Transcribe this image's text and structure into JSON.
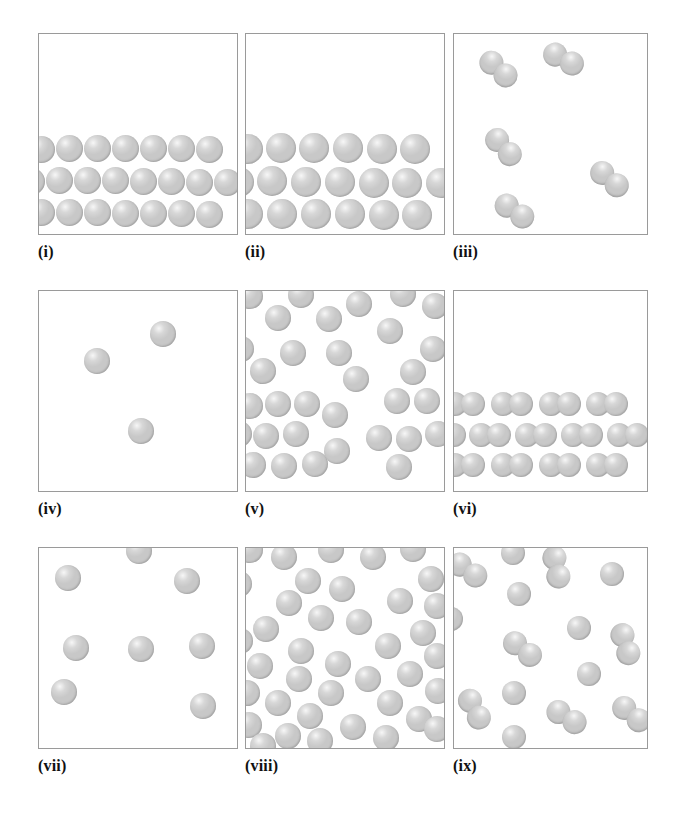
{
  "figure": {
    "title": "",
    "kind": "particle-arrangement-panels",
    "panel_count": 9,
    "background_color": "#ffffff",
    "frame_color": "#9a9a9a",
    "particle_color": "#c8c8c8"
  },
  "panels": [
    {
      "id": "i",
      "label": "(i)",
      "row": 0,
      "col": 0,
      "box": {
        "x": 38,
        "y": 33,
        "w": 200,
        "h": 202
      },
      "label_pos": {
        "x": 38,
        "y": 243
      },
      "description": "ordered close-packed rows of single atoms settled at bottom of container",
      "particle_type": "atom",
      "particle_count": 22,
      "radius": 13.5,
      "particles": [
        {
          "x": 40,
          "y": 148
        },
        {
          "x": 68,
          "y": 147
        },
        {
          "x": 96,
          "y": 147
        },
        {
          "x": 124,
          "y": 147
        },
        {
          "x": 152,
          "y": 147
        },
        {
          "x": 180,
          "y": 147
        },
        {
          "x": 208,
          "y": 148
        },
        {
          "x": 30,
          "y": 180
        },
        {
          "x": 58,
          "y": 179
        },
        {
          "x": 86,
          "y": 179
        },
        {
          "x": 114,
          "y": 179
        },
        {
          "x": 142,
          "y": 180
        },
        {
          "x": 170,
          "y": 180
        },
        {
          "x": 198,
          "y": 181
        },
        {
          "x": 226,
          "y": 181
        },
        {
          "x": 40,
          "y": 211
        },
        {
          "x": 68,
          "y": 211
        },
        {
          "x": 96,
          "y": 211
        },
        {
          "x": 124,
          "y": 212
        },
        {
          "x": 152,
          "y": 212
        },
        {
          "x": 180,
          "y": 212
        },
        {
          "x": 208,
          "y": 213
        }
      ],
      "molecules": []
    },
    {
      "id": "ii",
      "label": "(ii)",
      "row": 0,
      "col": 1,
      "box": {
        "x": 245,
        "y": 33,
        "w": 200,
        "h": 202
      },
      "label_pos": {
        "x": 245,
        "y": 243
      },
      "description": "ordered rows of larger single atoms settled at bottom of container",
      "particle_type": "atom",
      "particle_count": 19,
      "radius": 15,
      "particles": [
        {
          "x": 247,
          "y": 148
        },
        {
          "x": 280,
          "y": 147
        },
        {
          "x": 313,
          "y": 147
        },
        {
          "x": 347,
          "y": 147
        },
        {
          "x": 381,
          "y": 148
        },
        {
          "x": 414,
          "y": 148
        },
        {
          "x": 238,
          "y": 181
        },
        {
          "x": 271,
          "y": 180
        },
        {
          "x": 305,
          "y": 181
        },
        {
          "x": 339,
          "y": 181
        },
        {
          "x": 373,
          "y": 182
        },
        {
          "x": 406,
          "y": 182
        },
        {
          "x": 440,
          "y": 182
        },
        {
          "x": 247,
          "y": 213
        },
        {
          "x": 281,
          "y": 213
        },
        {
          "x": 315,
          "y": 213
        },
        {
          "x": 349,
          "y": 213
        },
        {
          "x": 383,
          "y": 214
        },
        {
          "x": 416,
          "y": 214
        }
      ],
      "molecules": []
    },
    {
      "id": "iii",
      "label": "(iii)",
      "row": 0,
      "col": 2,
      "box": {
        "x": 453,
        "y": 33,
        "w": 195,
        "h": 202
      },
      "label_pos": {
        "x": 453,
        "y": 243
      },
      "description": "sparse diatomic molecules dispersed throughout container (molecular gas)",
      "particle_type": "diatomic",
      "particle_count": 5,
      "radius": 12,
      "particles": [],
      "molecules": [
        {
          "x": 497,
          "y": 68,
          "angle": 42
        },
        {
          "x": 562,
          "y": 58,
          "angle": 28
        },
        {
          "x": 502,
          "y": 146,
          "angle": 48
        },
        {
          "x": 608,
          "y": 178,
          "angle": 40
        },
        {
          "x": 513,
          "y": 210,
          "angle": 35
        }
      ]
    },
    {
      "id": "iv",
      "label": "(iv)",
      "row": 1,
      "col": 0,
      "box": {
        "x": 38,
        "y": 290,
        "w": 200,
        "h": 202
      },
      "label_pos": {
        "x": 38,
        "y": 500
      },
      "description": "three widely separated single atoms (dilute monatomic gas)",
      "particle_type": "atom",
      "particle_count": 3,
      "radius": 13,
      "particles": [
        {
          "x": 96,
          "y": 360
        },
        {
          "x": 162,
          "y": 333
        },
        {
          "x": 140,
          "y": 430
        }
      ],
      "molecules": []
    },
    {
      "id": "v",
      "label": "(v)",
      "row": 1,
      "col": 1,
      "box": {
        "x": 245,
        "y": 290,
        "w": 200,
        "h": 202
      },
      "label_pos": {
        "x": 245,
        "y": 500
      },
      "description": "dense disordered single atoms filling the container (liquid)",
      "particle_type": "atom",
      "particle_count": 32,
      "radius": 13,
      "particles": [
        {
          "x": 249,
          "y": 295
        },
        {
          "x": 300,
          "y": 294
        },
        {
          "x": 358,
          "y": 303
        },
        {
          "x": 402,
          "y": 293
        },
        {
          "x": 434,
          "y": 305
        },
        {
          "x": 277,
          "y": 317
        },
        {
          "x": 328,
          "y": 318
        },
        {
          "x": 389,
          "y": 330
        },
        {
          "x": 240,
          "y": 348
        },
        {
          "x": 292,
          "y": 352
        },
        {
          "x": 338,
          "y": 352
        },
        {
          "x": 432,
          "y": 348
        },
        {
          "x": 262,
          "y": 370
        },
        {
          "x": 412,
          "y": 371
        },
        {
          "x": 355,
          "y": 378
        },
        {
          "x": 249,
          "y": 405
        },
        {
          "x": 277,
          "y": 403
        },
        {
          "x": 306,
          "y": 403
        },
        {
          "x": 334,
          "y": 414
        },
        {
          "x": 396,
          "y": 400
        },
        {
          "x": 426,
          "y": 400
        },
        {
          "x": 238,
          "y": 433
        },
        {
          "x": 265,
          "y": 435
        },
        {
          "x": 295,
          "y": 433
        },
        {
          "x": 378,
          "y": 437
        },
        {
          "x": 408,
          "y": 438
        },
        {
          "x": 437,
          "y": 433
        },
        {
          "x": 252,
          "y": 464
        },
        {
          "x": 283,
          "y": 465
        },
        {
          "x": 314,
          "y": 463
        },
        {
          "x": 336,
          "y": 450
        },
        {
          "x": 398,
          "y": 466
        }
      ],
      "molecules": []
    },
    {
      "id": "vi",
      "label": "(vi)",
      "row": 1,
      "col": 2,
      "box": {
        "x": 453,
        "y": 290,
        "w": 195,
        "h": 202
      },
      "label_pos": {
        "x": 453,
        "y": 500
      },
      "description": "ordered rows of horizontal diatomic molecules settled at bottom (molecular solid)",
      "particle_type": "diatomic",
      "particle_count": 13,
      "radius": 12,
      "particles": [],
      "molecules": [
        {
          "x": 463,
          "y": 403,
          "angle": 0
        },
        {
          "x": 511,
          "y": 403,
          "angle": 0
        },
        {
          "x": 559,
          "y": 403,
          "angle": 0
        },
        {
          "x": 606,
          "y": 403,
          "angle": 0
        },
        {
          "x": 444,
          "y": 434,
          "angle": 0
        },
        {
          "x": 489,
          "y": 434,
          "angle": 0
        },
        {
          "x": 535,
          "y": 434,
          "angle": 0
        },
        {
          "x": 581,
          "y": 434,
          "angle": 0
        },
        {
          "x": 627,
          "y": 434,
          "angle": 0
        },
        {
          "x": 463,
          "y": 464,
          "angle": 0
        },
        {
          "x": 511,
          "y": 464,
          "angle": 0
        },
        {
          "x": 559,
          "y": 464,
          "angle": 0
        },
        {
          "x": 606,
          "y": 464,
          "angle": 0
        }
      ]
    },
    {
      "id": "vii",
      "label": "(vii)",
      "row": 2,
      "col": 0,
      "box": {
        "x": 38,
        "y": 547,
        "w": 200,
        "h": 202
      },
      "label_pos": {
        "x": 38,
        "y": 757
      },
      "description": "eight widely separated single atoms (monatomic gas)",
      "particle_type": "atom",
      "particle_count": 8,
      "radius": 13,
      "particles": [
        {
          "x": 138,
          "y": 550
        },
        {
          "x": 67,
          "y": 577
        },
        {
          "x": 186,
          "y": 580
        },
        {
          "x": 75,
          "y": 647
        },
        {
          "x": 140,
          "y": 648
        },
        {
          "x": 201,
          "y": 645
        },
        {
          "x": 63,
          "y": 691
        },
        {
          "x": 202,
          "y": 705
        }
      ],
      "molecules": []
    },
    {
      "id": "viii",
      "label": "(viii)",
      "row": 2,
      "col": 1,
      "box": {
        "x": 245,
        "y": 547,
        "w": 200,
        "h": 202
      },
      "label_pos": {
        "x": 245,
        "y": 757
      },
      "description": "dense disordered single atoms filling the container (liquid)",
      "particle_type": "atom",
      "particle_count": 39,
      "radius": 13,
      "particles": [
        {
          "x": 249,
          "y": 549
        },
        {
          "x": 283,
          "y": 556
        },
        {
          "x": 330,
          "y": 549
        },
        {
          "x": 372,
          "y": 556
        },
        {
          "x": 412,
          "y": 548
        },
        {
          "x": 238,
          "y": 583
        },
        {
          "x": 307,
          "y": 580
        },
        {
          "x": 341,
          "y": 588
        },
        {
          "x": 430,
          "y": 578
        },
        {
          "x": 288,
          "y": 602
        },
        {
          "x": 399,
          "y": 600
        },
        {
          "x": 436,
          "y": 605
        },
        {
          "x": 320,
          "y": 617
        },
        {
          "x": 358,
          "y": 621
        },
        {
          "x": 265,
          "y": 628
        },
        {
          "x": 422,
          "y": 632
        },
        {
          "x": 239,
          "y": 640
        },
        {
          "x": 387,
          "y": 645
        },
        {
          "x": 300,
          "y": 650
        },
        {
          "x": 436,
          "y": 655
        },
        {
          "x": 259,
          "y": 665
        },
        {
          "x": 337,
          "y": 663
        },
        {
          "x": 298,
          "y": 678
        },
        {
          "x": 367,
          "y": 678
        },
        {
          "x": 409,
          "y": 673
        },
        {
          "x": 246,
          "y": 692
        },
        {
          "x": 330,
          "y": 692
        },
        {
          "x": 437,
          "y": 690
        },
        {
          "x": 277,
          "y": 702
        },
        {
          "x": 389,
          "y": 702
        },
        {
          "x": 309,
          "y": 715
        },
        {
          "x": 418,
          "y": 718
        },
        {
          "x": 248,
          "y": 724
        },
        {
          "x": 352,
          "y": 726
        },
        {
          "x": 436,
          "y": 728
        },
        {
          "x": 287,
          "y": 735
        },
        {
          "x": 385,
          "y": 737
        },
        {
          "x": 319,
          "y": 740
        },
        {
          "x": 262,
          "y": 745
        }
      ],
      "molecules": []
    },
    {
      "id": "ix",
      "label": "(ix)",
      "row": 2,
      "col": 2,
      "box": {
        "x": 453,
        "y": 547,
        "w": 195,
        "h": 202
      },
      "label_pos": {
        "x": 453,
        "y": 757
      },
      "description": "mixture of single atoms and diatomic molecules dispersed in container",
      "particle_type": "mixed",
      "particle_count": 21,
      "radius": 12,
      "particles": [
        {
          "x": 512,
          "y": 552
        },
        {
          "x": 611,
          "y": 573
        },
        {
          "x": 518,
          "y": 593
        },
        {
          "x": 450,
          "y": 618
        },
        {
          "x": 578,
          "y": 627
        },
        {
          "x": 588,
          "y": 673
        },
        {
          "x": 513,
          "y": 692
        },
        {
          "x": 513,
          "y": 736
        }
      ],
      "molecules": [
        {
          "x": 466,
          "y": 569,
          "angle": 35
        },
        {
          "x": 555,
          "y": 566,
          "angle": 78
        },
        {
          "x": 521,
          "y": 648,
          "angle": 38
        },
        {
          "x": 624,
          "y": 643,
          "angle": 72
        },
        {
          "x": 473,
          "y": 708,
          "angle": 62
        },
        {
          "x": 565,
          "y": 716,
          "angle": 32
        },
        {
          "x": 630,
          "y": 713,
          "angle": 40
        }
      ]
    }
  ]
}
